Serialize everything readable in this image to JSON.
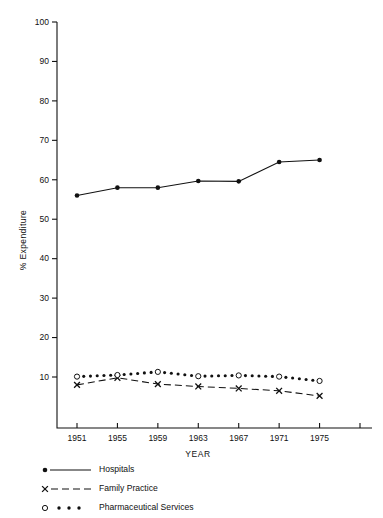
{
  "chart_data": {
    "type": "line",
    "title": "",
    "xlabel": "YEAR",
    "ylabel": "% Expenditure",
    "xlim": [
      1950,
      1979
    ],
    "ylim": [
      0,
      100
    ],
    "ytick_labels": [
      "100",
      "90",
      "80",
      "70",
      "60",
      "50",
      "40",
      "30",
      "20",
      "10"
    ],
    "ytick_values": [
      100,
      90,
      80,
      70,
      60,
      50,
      40,
      30,
      20,
      10
    ],
    "xtick_labels": [
      "1951",
      "1955",
      "1959",
      "1963",
      "1967",
      "1971",
      "1975",
      ""
    ],
    "xtick_values": [
      1951,
      1955,
      1959,
      1963,
      1967,
      1971,
      1975,
      1979
    ],
    "grid": false,
    "legend_position": "below-axes",
    "x": [
      1951,
      1955,
      1959,
      1963,
      1967,
      1971,
      1975
    ],
    "series": [
      {
        "name": "Hospitals",
        "marker": "filled-circle",
        "line": "solid",
        "values": [
          56.0,
          58.0,
          58.0,
          59.7,
          59.6,
          64.5,
          65.0
        ]
      },
      {
        "name": "Family Practice",
        "marker": "x",
        "line": "dashed",
        "values": [
          8.0,
          9.8,
          8.2,
          7.6,
          7.1,
          6.5,
          5.2
        ]
      },
      {
        "name": "Pharmaceutical Services",
        "marker": "open-circle",
        "line": "dotted",
        "values": [
          10.1,
          10.5,
          11.3,
          10.2,
          10.4,
          10.1,
          9.0
        ]
      }
    ]
  },
  "legend": {
    "items": [
      {
        "label": "Hospitals",
        "style": "solid-filled-dot"
      },
      {
        "label": "Family Practice",
        "style": "dashed-x"
      },
      {
        "label": "Pharmaceutical Services",
        "style": "dotted-open-circle"
      }
    ]
  },
  "axes": {
    "y_title": "% Expenditure",
    "x_title": "YEAR"
  }
}
